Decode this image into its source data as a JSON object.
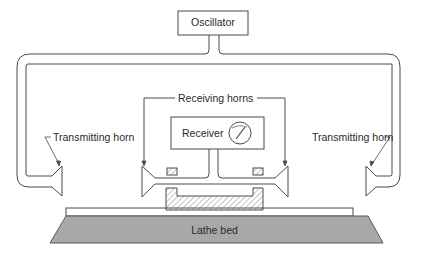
{
  "diagram": {
    "oscillator": {
      "label": "Oscillator"
    },
    "receiver": {
      "label": "Receiver"
    },
    "receiving_horns": {
      "label": "Receiving horns"
    },
    "transmitting_horn_left": {
      "label": "Transmitting horn"
    },
    "transmitting_horn_right": {
      "label": "Transmitting horn"
    },
    "lathe_bed": {
      "label": "Lathe bed"
    }
  },
  "colors": {
    "line": "#4a4a4a",
    "text": "#2a2a2a",
    "lathe_bed_fill": "#a8a8a8",
    "hatch": "#6a6a6a",
    "background": "#ffffff"
  }
}
